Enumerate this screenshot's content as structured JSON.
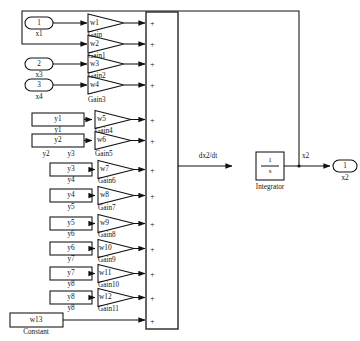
{
  "diagram": {
    "sum_block": {
      "name": "Sum",
      "sign_symbol": "+",
      "input_count": 13
    },
    "integrator": {
      "numerator": "1",
      "denominator": "s",
      "label": "Integrator",
      "input_signal_label": "dx2/dt",
      "output_signal_label": "x2"
    },
    "output_port": {
      "number": "1",
      "label": "x2"
    },
    "input_ports": [
      {
        "number": "1",
        "label": "x1"
      },
      {
        "number": "2",
        "label": "x3"
      },
      {
        "number": "3",
        "label": "x4"
      }
    ],
    "source_blocks": [
      {
        "value": "y1",
        "label": "y1"
      },
      {
        "value": "y2",
        "label": "y2"
      },
      {
        "value": "y3",
        "label": "y3",
        "extra_label": "y2"
      },
      {
        "value": "y4",
        "label": "y4"
      },
      {
        "value": "y5",
        "label": "y5"
      },
      {
        "value": "y6",
        "label": "y6"
      },
      {
        "value": "y7",
        "label": "y7"
      },
      {
        "value": "y8",
        "label": "y8"
      }
    ],
    "constant_block": {
      "value": "w13",
      "label": "Constant"
    },
    "gains": [
      {
        "value": "w1",
        "label": "Gain"
      },
      {
        "value": "w2",
        "label": "Gain1"
      },
      {
        "value": "w3",
        "label": "Gain2"
      },
      {
        "value": "w4",
        "label": "Gain3"
      },
      {
        "value": "w5",
        "label": "Gain4"
      },
      {
        "value": "w6",
        "label": "Gain5"
      },
      {
        "value": "w7",
        "label": "Gain6"
      },
      {
        "value": "w8",
        "label": "Gain7"
      },
      {
        "value": "w9",
        "label": "Gain8"
      },
      {
        "value": "w10",
        "label": "Gain9"
      },
      {
        "value": "w11",
        "label": "Gain10"
      },
      {
        "value": "w12",
        "label": "Gain11"
      }
    ],
    "colors": {
      "line": "#111111",
      "background": "#ffffff",
      "sum_border": "#333333"
    }
  }
}
